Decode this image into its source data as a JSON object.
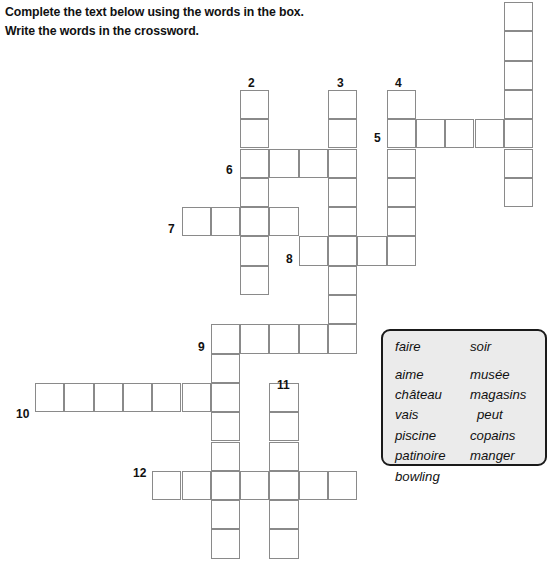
{
  "instructions": {
    "line1": "Complete the text below using the words in the box.",
    "line2": "Write the words in the crossword."
  },
  "crossword": {
    "geometry": {
      "cell_size": 29.3,
      "origin_x": 35,
      "origin_y": 2,
      "note": "Grid columns indexed from origin_x, rows from origin_y"
    },
    "entries": [
      {
        "number": "1",
        "direction": "down",
        "col": 16,
        "row": 0,
        "length": 7,
        "numbered": false
      },
      {
        "number": "2",
        "direction": "down",
        "col": 7,
        "row": 3,
        "length": 7,
        "numbered": true
      },
      {
        "number": "3",
        "direction": "down",
        "col": 10,
        "row": 3,
        "length": 9,
        "numbered": true
      },
      {
        "number": "4",
        "direction": "down",
        "col": 12,
        "row": 3,
        "length": 6,
        "numbered": true
      },
      {
        "number": "5",
        "direction": "across",
        "col": 12,
        "row": 4,
        "length": 4,
        "numbered": true
      },
      {
        "number": "6",
        "direction": "across",
        "col": 7,
        "row": 5,
        "length": 4,
        "numbered": true
      },
      {
        "number": "7",
        "direction": "across",
        "col": 5,
        "row": 7,
        "length": 4,
        "numbered": true
      },
      {
        "number": "8",
        "direction": "across",
        "col": 9,
        "row": 8,
        "length": 4,
        "numbered": true
      },
      {
        "number": "9",
        "direction": "across",
        "col": 6,
        "row": 11,
        "length": 5,
        "numbered": true
      },
      {
        "number": "9d",
        "direction": "down",
        "col": 6,
        "row": 11,
        "length": 8,
        "numbered": false
      },
      {
        "number": "10",
        "direction": "across",
        "col": 0,
        "row": 13,
        "length": 7,
        "numbered": true
      },
      {
        "number": "11",
        "direction": "down",
        "col": 8,
        "row": 13,
        "length": 6,
        "numbered": true
      },
      {
        "number": "12",
        "direction": "across",
        "col": 4,
        "row": 16,
        "length": 7,
        "numbered": true
      }
    ],
    "clue_numbers": [
      {
        "label": "2",
        "x": 248,
        "y": 77
      },
      {
        "label": "3",
        "x": 337,
        "y": 77
      },
      {
        "label": "4",
        "x": 395,
        "y": 77
      },
      {
        "label": "5",
        "x": 374,
        "y": 132
      },
      {
        "label": "6",
        "x": 226,
        "y": 164
      },
      {
        "label": "7",
        "x": 168,
        "y": 223
      },
      {
        "label": "8",
        "x": 286,
        "y": 253
      },
      {
        "label": "9",
        "x": 198,
        "y": 341
      },
      {
        "label": "10",
        "x": 16,
        "y": 408
      },
      {
        "label": "11",
        "x": 277,
        "y": 379
      },
      {
        "label": "12",
        "x": 133,
        "y": 467
      }
    ]
  },
  "wordbank": {
    "left_column": [
      "faire",
      "aime",
      "château",
      "vais",
      "piscine",
      "patinoire",
      "bowling"
    ],
    "right_column": [
      "soir",
      "musée",
      "magasins",
      "peut",
      "copains",
      "manger"
    ],
    "background_color": "#ebebeb",
    "border_color": "#1a1a1a"
  }
}
